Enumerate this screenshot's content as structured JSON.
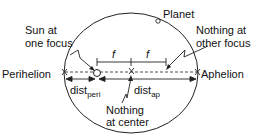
{
  "diagram": {
    "type": "orbital-ellipse",
    "labels": {
      "planet": "Planet",
      "sun_focus_line1": "Sun at",
      "sun_focus_line2": "one focus",
      "other_focus_line1": "Nothing at",
      "other_focus_line2": "other focus",
      "perihelion": "Perihelion",
      "aphelion": "Aphelion",
      "dist_peri_main": "dist",
      "dist_peri_sub": "peri",
      "dist_ap_main": "dist",
      "dist_ap_sub": "ap",
      "center_line1": "Nothing",
      "center_line2": "at center",
      "focal_left": "f",
      "focal_right": "f"
    },
    "colors": {
      "stroke": "#222222",
      "text": "#111111",
      "background": "#ffffff"
    }
  }
}
